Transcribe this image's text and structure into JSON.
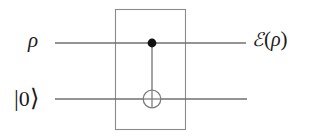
{
  "figure": {
    "background_color": "#ffffff",
    "line_color": "#6b6b6b",
    "wire_color": "#707070",
    "text_color": "#1b1b1b",
    "control_dot_color": "#111111"
  },
  "labels": {
    "input_top": "ρ",
    "input_bottom_bar": "|",
    "input_bottom_value": "0",
    "input_bottom_ket": "⟩",
    "output_e": "ℰ",
    "output_open_paren": "(",
    "output_rho": "ρ",
    "output_close_paren": ")"
  },
  "wires": [
    {
      "name": "top-wire",
      "label": "ρ",
      "y": 43,
      "x_start": 55,
      "x_end": 246
    },
    {
      "name": "bottom-wire",
      "label": "|0⟩",
      "y": 99,
      "x_start": 55,
      "x_end": 247
    }
  ],
  "gate": {
    "name": "cnot-gate",
    "control_x": 152,
    "control_y": 43,
    "control_radius": 4.5,
    "target_x": 152,
    "target_y": 99,
    "target_radius": 9
  },
  "box": {
    "name": "operation-box",
    "x": 115,
    "y": 9,
    "width": 71,
    "height": 121
  }
}
